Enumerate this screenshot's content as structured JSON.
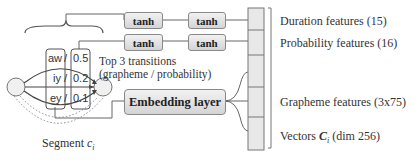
{
  "diagram": {
    "tanh_label": "tanh",
    "embedding_label": "Embedding layer",
    "transitions_title_line1": "Top 3 transitions",
    "transitions_title_line2": "(grapheme / probability)",
    "transitions": [
      {
        "grapheme": "aw",
        "sep": "/",
        "prob": "0.5"
      },
      {
        "grapheme": "iy",
        "sep": "/",
        "prob": "0.2"
      },
      {
        "grapheme": "ey",
        "sep": "/",
        "prob": "0.1"
      }
    ],
    "segment_label": "Segment ",
    "segment_var": "c",
    "segment_sub": "i",
    "features": {
      "duration": "Duration features (15)",
      "probability": "Probability features (16)",
      "grapheme": "Grapheme features (3x75)",
      "vectors_prefix": "Vectors ",
      "vectors_var": "C",
      "vectors_sub": "i",
      "vectors_suffix": " (dim 256)"
    }
  }
}
